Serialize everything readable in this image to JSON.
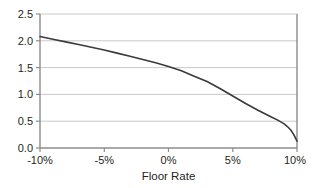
{
  "chart_data": {
    "type": "line",
    "title": "",
    "xlabel": "Floor Rate",
    "ylabel": "",
    "xlim": [
      -10,
      10
    ],
    "ylim": [
      0.0,
      2.5
    ],
    "grid": true,
    "legend": null,
    "x_tick_labels": [
      "-10%",
      "-5%",
      "0%",
      "5%",
      "10%"
    ],
    "x_tick_values": [
      -10,
      -5,
      0,
      5,
      10
    ],
    "y_tick_labels": [
      "0.0",
      "0.5",
      "1.0",
      "1.5",
      "2.0",
      "2.5"
    ],
    "y_tick_values": [
      0.0,
      0.5,
      1.0,
      1.5,
      2.0,
      2.5
    ],
    "series": [
      {
        "name": "value",
        "color": "#3a3a3a",
        "x": [
          -10.0,
          -9.0,
          -8.0,
          -7.0,
          -6.0,
          -5.0,
          -4.0,
          -3.0,
          -2.0,
          -1.0,
          0.0,
          1.0,
          2.0,
          3.0,
          4.0,
          5.0,
          6.0,
          7.0,
          8.0,
          8.5,
          9.0,
          9.25,
          9.5,
          9.75,
          10.0
        ],
        "y": [
          2.08,
          2.03,
          1.98,
          1.93,
          1.88,
          1.83,
          1.77,
          1.71,
          1.65,
          1.59,
          1.52,
          1.44,
          1.34,
          1.24,
          1.11,
          0.97,
          0.83,
          0.7,
          0.58,
          0.52,
          0.45,
          0.4,
          0.34,
          0.25,
          0.13
        ]
      }
    ]
  },
  "axes": {
    "x_axis_title": "Floor Rate",
    "x_ticks": [
      {
        "label": "-10%"
      },
      {
        "label": "-5%"
      },
      {
        "label": "0%"
      },
      {
        "label": "5%"
      },
      {
        "label": "10%"
      }
    ],
    "y_ticks": [
      {
        "label": "2.5"
      },
      {
        "label": "2.0"
      },
      {
        "label": "1.5"
      },
      {
        "label": "1.0"
      },
      {
        "label": "0.5"
      },
      {
        "label": "0.0"
      }
    ]
  },
  "style": {
    "line_color": "#3a3a3a",
    "grid_color": "#c9c9c9",
    "axis_color": "#8c8c8c",
    "text_color": "#231f20",
    "background": "#ffffff"
  }
}
